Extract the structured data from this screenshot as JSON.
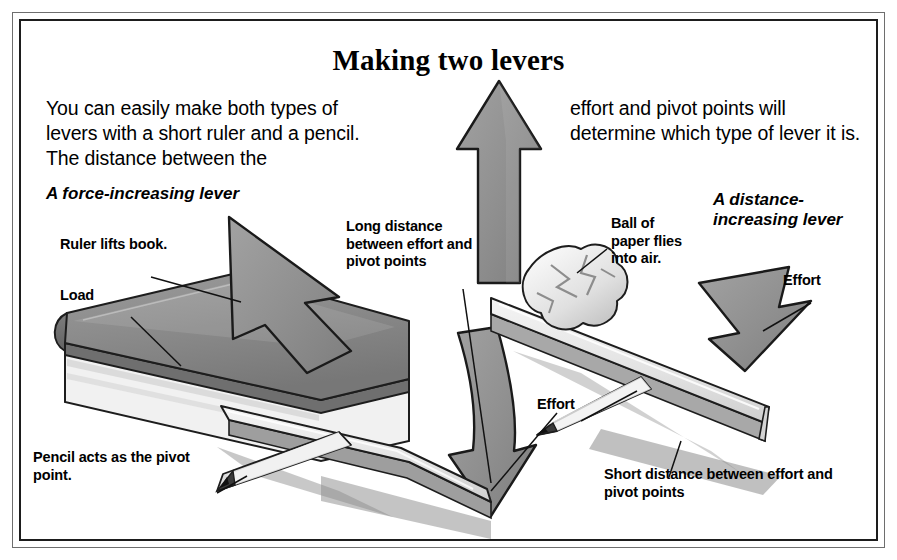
{
  "figure": {
    "title": "Making two levers",
    "paragraphs": {
      "left": "You can easily make both types of levers with a short ruler and a pencil. The distance between the",
      "right": "effort and pivot points will determine which type of lever it is."
    },
    "lever_labels": {
      "left": "A force-increasing lever",
      "right": "A distance-increasing lever"
    },
    "annotations": {
      "ruler_lifts_book": "Ruler lifts book.",
      "load": "Load",
      "long_distance": "Long distance between effort and pivot points",
      "ball_of_paper": "Ball of paper flies into air.",
      "effort_left": "Effort",
      "effort_right": "Effort",
      "pencil_pivot": "Pencil acts as the pivot point.",
      "short_distance": "Short distance between effort and pivot points"
    },
    "colors": {
      "ink": "#000000",
      "paper": "#ffffff",
      "arrow_fill": "#919191",
      "arrow_stroke": "#1a1a1a",
      "book_top": "#8d8d8d",
      "book_side": "#6b6b6b",
      "book_pages": "#f2f2f2",
      "ruler_face": "#e9e9e9",
      "ruler_edge": "#b9b9b9",
      "shadow": "#8a8a8a",
      "frame_outer": "#6e6e6e",
      "frame_inner": "#1d1d1d"
    },
    "icons": {
      "up_arrow": "arrow-up-icon",
      "down_arrow": "arrow-down-curved-icon",
      "effort_arrow_left": "arrow-up-left-icon",
      "effort_arrow_right": "arrow-down-right-icon"
    }
  }
}
